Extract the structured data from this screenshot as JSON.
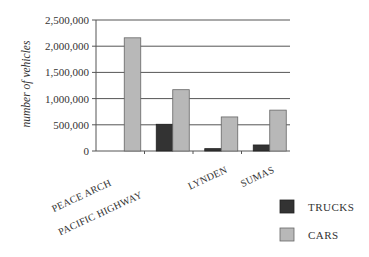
{
  "chart_data": {
    "type": "bar",
    "title": "",
    "xlabel": "",
    "ylabel": "number of vehicles",
    "ylim": [
      0,
      2500000
    ],
    "yticks": [
      0,
      500000,
      1000000,
      1500000,
      2000000,
      2500000
    ],
    "ytick_labels": [
      "0",
      "500,000",
      "1,000,000",
      "1,500,000",
      "2,000,000",
      "2,500,000"
    ],
    "grid": true,
    "legend_position": "bottom-right",
    "categories": [
      "PEACE ARCH",
      "PACIFIC HIGHWAY",
      "LYNDEN",
      "SUMAS"
    ],
    "series": [
      {
        "name": "TRUCKS",
        "color": "#333333",
        "values": [
          0,
          510000,
          45000,
          115000
        ]
      },
      {
        "name": "CARS",
        "color": "#b8b8b8",
        "values": [
          2160000,
          1170000,
          650000,
          780000
        ]
      }
    ]
  }
}
